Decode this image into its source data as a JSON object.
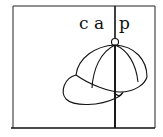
{
  "card": {
    "word": "cap",
    "letters": [
      "c",
      "a",
      "p"
    ],
    "image": "cap-icon",
    "stroke_color": "#111111",
    "background": "#ffffff"
  }
}
